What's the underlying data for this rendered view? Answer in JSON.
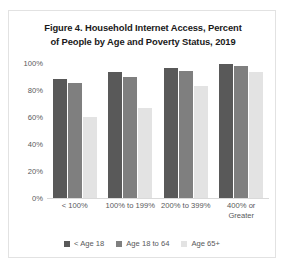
{
  "figure": {
    "title_line_1": "Figure 4. Household Internet Access, Percent",
    "title_line_2": "of People by Age and Poverty Status, 2019"
  },
  "chart_data": {
    "type": "bar",
    "title": "Figure 4. Household Internet Access, Percent of People by Age and Poverty Status, 2019",
    "xlabel": "",
    "ylabel": "",
    "ylim": [
      0,
      100
    ],
    "grid": false,
    "legend_position": "bottom",
    "categories": [
      "< 100%",
      "100% to 199%",
      "200% to 399%",
      "400% or\nGreater"
    ],
    "ytick_labels": [
      "100%",
      "80%",
      "60%",
      "40%",
      "20%",
      "0%"
    ],
    "ytick_values": [
      100,
      80,
      60,
      40,
      20,
      0
    ],
    "series": [
      {
        "name": "< Age 18",
        "color": "#595959",
        "values": [
          88,
          93,
          96,
          99
        ]
      },
      {
        "name": "Age 18 to 64",
        "color": "#7f7f7f",
        "values": [
          85,
          90,
          94,
          98
        ]
      },
      {
        "name": "Age 65+",
        "color": "#e3e3e3",
        "values": [
          60,
          67,
          83,
          93
        ]
      }
    ]
  }
}
